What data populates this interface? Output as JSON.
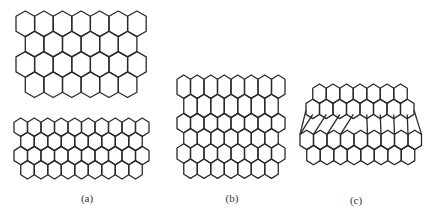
{
  "figure": {
    "stroke_color": "#2a2a2a",
    "background": "#ffffff",
    "panels": [
      {
        "id": "a-top",
        "label": "",
        "type": "regular",
        "x0": 16,
        "y0": 11,
        "cell_w": 18.6,
        "tip": 5.3,
        "body": 15,
        "rows": 4,
        "cols_even": 7,
        "cols_odd": 6
      },
      {
        "id": "a-bottom",
        "label": "(a)",
        "label_x": 87,
        "label_y": 192,
        "type": "regular",
        "x0": 14,
        "y0": 118,
        "cell_w": 13.5,
        "tip": 4.2,
        "body": 10,
        "rows": 4,
        "cols_even": 10,
        "cols_odd": 9
      },
      {
        "id": "b",
        "label": "(b)",
        "label_x": 232,
        "label_y": 192,
        "type": "elongated",
        "x0": 177,
        "y0": 75,
        "cell_w": 13.5,
        "tip": 4.2,
        "bodies": [
          15,
          15,
          11,
          11,
          11,
          11
        ],
        "cols_even": 8,
        "cols_odd": 7
      },
      {
        "id": "c",
        "label": "(c)",
        "label_x": 356,
        "label_y": 194,
        "type": "distorted",
        "x0": 300,
        "y0": 84,
        "cell_w": 13.5,
        "tip": 4.2,
        "body": 11,
        "top_rows": 2,
        "bottom_rows": 2,
        "cols_first": 7,
        "cols_second": 8,
        "band_height": 20
      }
    ]
  }
}
